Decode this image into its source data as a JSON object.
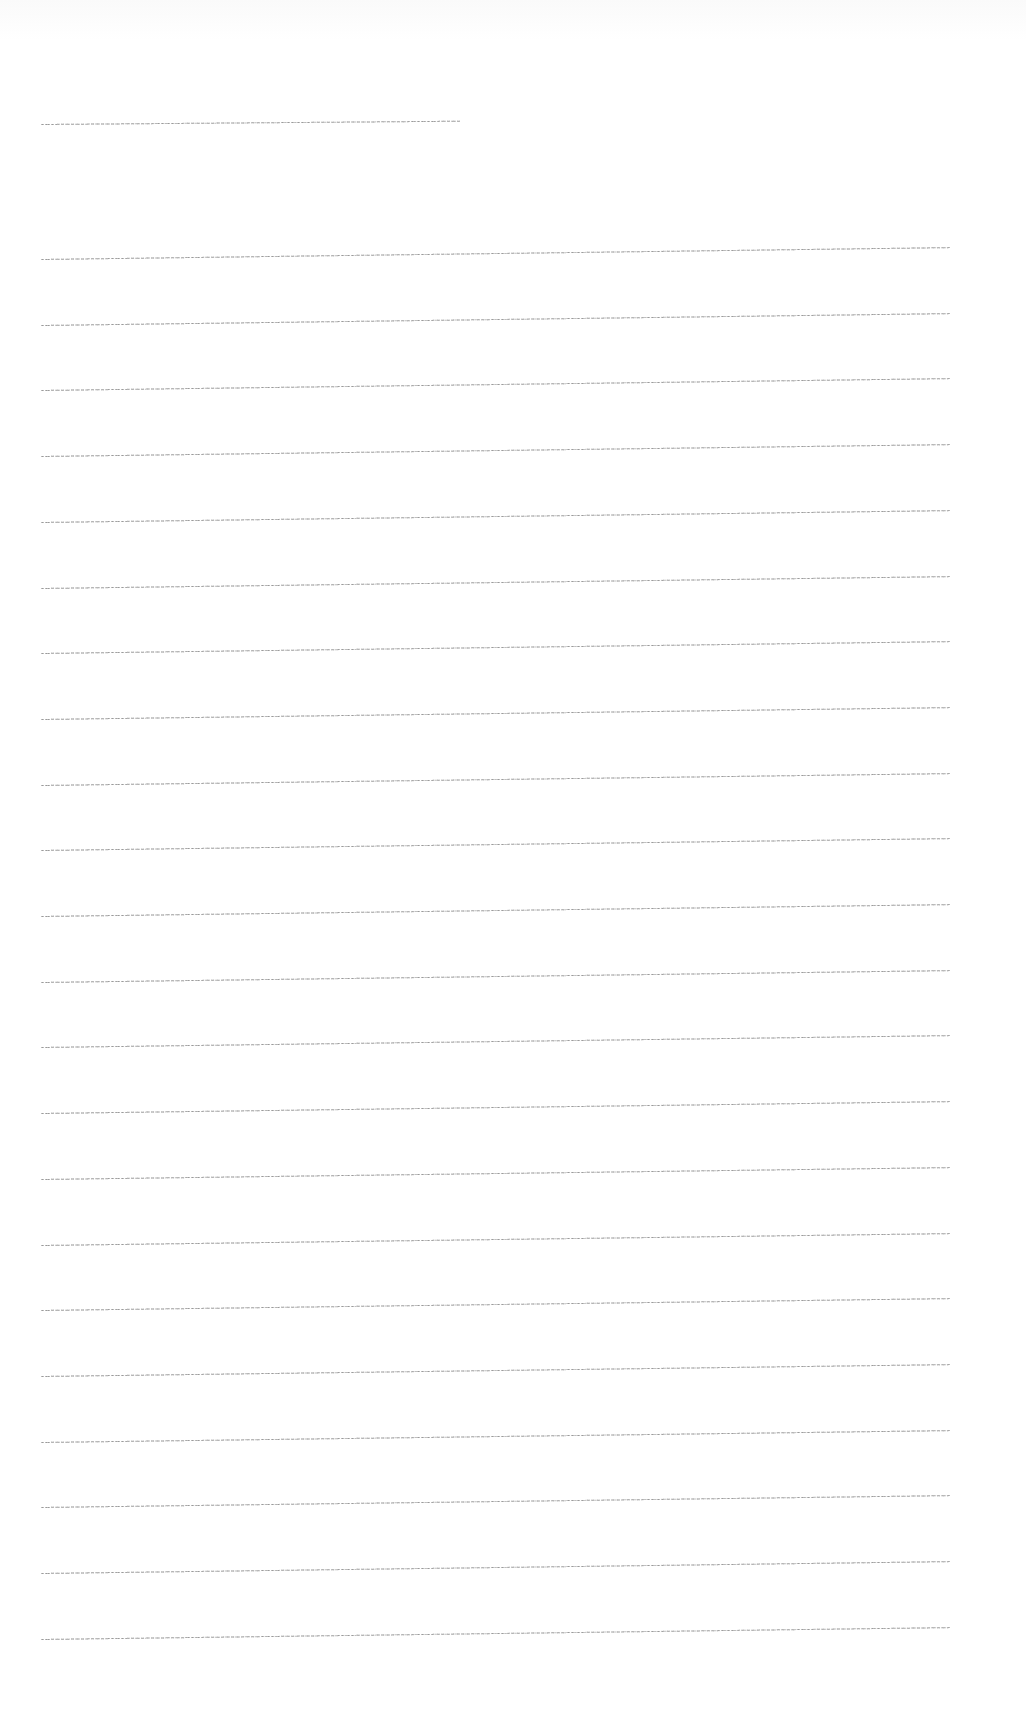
{
  "document": {
    "type": "lined-paper",
    "line_color": "#8a8a8a",
    "background": "#ffffff",
    "header_line": {
      "x1": 41,
      "x2": 460,
      "y": 124
    },
    "ruled_lines": {
      "count": 22,
      "x_start": 41,
      "x_end": 950,
      "y_start": 259,
      "spacing": 65.7,
      "tilt_deg": -0.75
    }
  }
}
